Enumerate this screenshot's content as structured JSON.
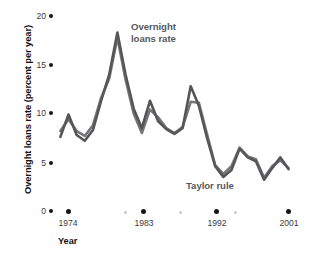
{
  "chart_data": {
    "type": "line",
    "title": "",
    "xlabel": "Year",
    "ylabel": "Overnight loans rate (percent per year)",
    "xlim": [
      1972,
      2002
    ],
    "ylim": [
      0,
      20
    ],
    "yticks": [
      0,
      5,
      10,
      15,
      20
    ],
    "ytick_labels": [
      "0",
      "5",
      "10",
      "15",
      "20"
    ],
    "xticks": [
      1974,
      1983,
      1992,
      2001
    ],
    "xtick_labels": [
      "1974",
      "1983",
      "1992",
      "2001"
    ],
    "minor_xticks": [
      1977,
      1986,
      1995
    ],
    "grid": false,
    "legend": "inline-annotations",
    "annotations": [
      {
        "text_line1": "Overnight",
        "text_line2": "loans rate",
        "x": 1983,
        "y": 17.0
      },
      {
        "text_line1": "Taylor rule",
        "text_line2": "",
        "x": 1991,
        "y": 3.6
      }
    ],
    "series": [
      {
        "name": "Overnight loans rate",
        "color": "#4c4c4e",
        "x": [
          1973,
          1974,
          1975,
          1976,
          1977,
          1978,
          1979,
          1980,
          1981,
          1982,
          1983,
          1984,
          1985,
          1986,
          1987,
          1988,
          1989,
          1990,
          1991,
          1992,
          1993,
          1994,
          1995,
          1996,
          1997,
          1998,
          1999,
          2000,
          2001
        ],
        "values": [
          7.6,
          9.9,
          7.8,
          7.2,
          8.3,
          11.3,
          14.0,
          18.3,
          14.0,
          10.5,
          8.5,
          11.3,
          9.2,
          8.4,
          7.9,
          8.5,
          12.8,
          10.8,
          7.5,
          4.6,
          3.5,
          4.2,
          6.4,
          5.5,
          5.1,
          3.2,
          4.4,
          5.5,
          4.3
        ]
      },
      {
        "name": "Taylor rule",
        "color": "#58585a",
        "x": [
          1973,
          1974,
          1975,
          1976,
          1977,
          1978,
          1979,
          1980,
          1981,
          1982,
          1983,
          1984,
          1985,
          1986,
          1987,
          1988,
          1989,
          1990,
          1991,
          1992,
          1993,
          1994,
          1995,
          1996,
          1997,
          1998,
          1999,
          2000,
          2001
        ],
        "values": [
          8.2,
          9.4,
          8.2,
          7.7,
          8.8,
          11.6,
          13.6,
          17.8,
          13.5,
          10.0,
          8.0,
          10.4,
          9.6,
          8.5,
          8.0,
          8.6,
          11.2,
          11.1,
          7.9,
          4.7,
          3.8,
          4.6,
          6.5,
          5.6,
          5.3,
          3.4,
          4.6,
          5.2,
          4.4
        ]
      }
    ]
  },
  "axes": {
    "y_title": "Overnight loans rate (percent per year)",
    "x_title": "Year",
    "y_labels": [
      "20",
      "15",
      "10",
      "5",
      "0"
    ],
    "x_labels": [
      "1974",
      "1983",
      "1992",
      "2001"
    ]
  },
  "labels": {
    "overnight_line1": "Overnight",
    "overnight_line2": "loans rate",
    "taylor": "Taylor rule"
  }
}
